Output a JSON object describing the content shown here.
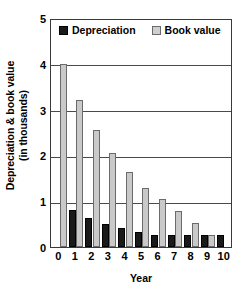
{
  "chart_data": {
    "type": "bar",
    "title": "",
    "xlabel": "Year",
    "ylabel_line1": "Depreciation & book value",
    "ylabel_line2": "(in thousands)",
    "categories": [
      "0",
      "1",
      "2",
      "3",
      "4",
      "5",
      "6",
      "7",
      "8",
      "9",
      "10"
    ],
    "series": [
      {
        "name": "Depreciation",
        "color": "#1a1a1a",
        "values": [
          0,
          0.8,
          0.64,
          0.51,
          0.41,
          0.33,
          0.26,
          0.26,
          0.26,
          0.26,
          0.26
        ]
      },
      {
        "name": "Book value",
        "color": "#c9c9c9",
        "values": [
          4.0,
          3.2,
          2.56,
          2.05,
          1.64,
          1.29,
          1.04,
          0.78,
          0.52,
          0.26,
          0
        ]
      }
    ],
    "ylim": [
      0,
      5
    ],
    "yticks": [
      "0",
      "1",
      "2",
      "3",
      "4",
      "5"
    ],
    "grid": true,
    "legend_position": "top-left-inside"
  },
  "legend": {
    "items": [
      {
        "label": "Depreciation",
        "swatch": "black-square-swatch"
      },
      {
        "label": "Book value",
        "swatch": "gray-square-swatch"
      }
    ]
  }
}
